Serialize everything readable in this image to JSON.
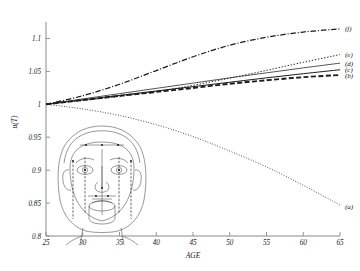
{
  "figure": {
    "background_color": "#ffffff",
    "line_color": "#1c1c1c",
    "axis_color": "#8a8a8a"
  },
  "chart_data": {
    "type": "line",
    "title": "",
    "subtitle": "",
    "xlabel": "AGE",
    "ylabel": "u(T)",
    "xlim": [
      25,
      65
    ],
    "ylim": [
      0.8,
      1.125
    ],
    "xticks": [
      25,
      30,
      35,
      40,
      45,
      50,
      55,
      60,
      65
    ],
    "xticklabels": [
      "25",
      "30",
      "35",
      "40",
      "45",
      "50",
      "55",
      "60",
      "65"
    ],
    "yticks": [
      0.8,
      0.85,
      0.9,
      0.95,
      1,
      1.05,
      1.1
    ],
    "yticklabels": [
      "0.8",
      "0.85",
      "0.9",
      "0.95",
      "1",
      "1.05",
      "1.1"
    ],
    "grid": false,
    "legend_position": "right-inline",
    "x": [
      25,
      30,
      35,
      40,
      45,
      50,
      55,
      60,
      65
    ],
    "series": [
      {
        "name": "(a)",
        "label": "(a)",
        "style": "fine-dotted",
        "dasharray": "0.9 1.7",
        "width": 0.85,
        "label_x": 65,
        "label_y": 0.845,
        "values": [
          1.0,
          0.993,
          0.983,
          0.969,
          0.951,
          0.929,
          0.905,
          0.877,
          0.847
        ]
      },
      {
        "name": "(b)",
        "label": "(b)",
        "style": "thick-dashed",
        "dasharray": "5 2.4",
        "width": 1.9,
        "label_x": 65,
        "label_y": 1.0445,
        "values": [
          1.0,
          1.0065,
          1.0128,
          1.0188,
          1.0248,
          1.0312,
          1.0365,
          1.0412,
          1.0445
        ]
      },
      {
        "name": "(c)",
        "label": "(c)",
        "style": "solid",
        "dasharray": "none",
        "width": 1.0,
        "label_x": 65,
        "label_y": 1.0525,
        "values": [
          1.0,
          1.0068,
          1.0135,
          1.0202,
          1.0268,
          1.0335,
          1.0402,
          1.0465,
          1.0525
        ]
      },
      {
        "name": "(d)",
        "label": "(d)",
        "style": "thin-solid",
        "dasharray": "none",
        "width": 0.75,
        "label_x": 65,
        "label_y": 1.0625,
        "values": [
          1.0,
          1.0082,
          1.0162,
          1.0242,
          1.0322,
          1.0402,
          1.0478,
          1.0553,
          1.0625
        ]
      },
      {
        "name": "(e)",
        "label": "(e)",
        "style": "dotted",
        "dasharray": "1.3 1.8",
        "width": 1.0,
        "label_x": 65,
        "label_y": 1.0755,
        "values": [
          1.0,
          1.0058,
          1.0122,
          1.0196,
          1.0288,
          1.0398,
          1.0515,
          1.0638,
          1.0755
        ]
      },
      {
        "name": "(f)",
        "label": "(f)",
        "style": "dash-dot",
        "dasharray": "5.5 1.8 1.1 1.8",
        "width": 1.25,
        "label_x": 65,
        "label_y": 1.1145,
        "values": [
          1.0,
          1.013,
          1.0305,
          1.0512,
          1.0722,
          1.0898,
          1.1018,
          1.1098,
          1.1145
        ]
      }
    ]
  },
  "overlay": {
    "name": "anthropometric-face-diagram",
    "description": "Frontal face line drawing with landmark points and vertical measurement lines"
  }
}
